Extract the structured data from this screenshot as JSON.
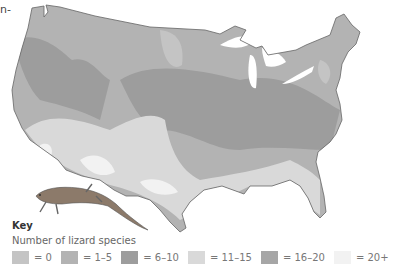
{
  "caption_fragment": "n-",
  "map": {
    "title": "Lizard species richness across the contiguous United States",
    "region": "Contiguous United States"
  },
  "key": {
    "title": "Key",
    "subtitle": "Number of lizard species",
    "items": [
      {
        "label": "= 0",
        "color": "#c4c4c4"
      },
      {
        "label": "= 1–5",
        "color": "#b3b3b3"
      },
      {
        "label": "= 6–10",
        "color": "#9d9d9d"
      },
      {
        "label": "= 11–15",
        "color": "#d9d9d9"
      },
      {
        "label": "= 16–20",
        "color": "#a6a6a6"
      },
      {
        "label": "= 20+",
        "color": "#f2f2f2"
      }
    ]
  },
  "illustration": "lizard-icon"
}
